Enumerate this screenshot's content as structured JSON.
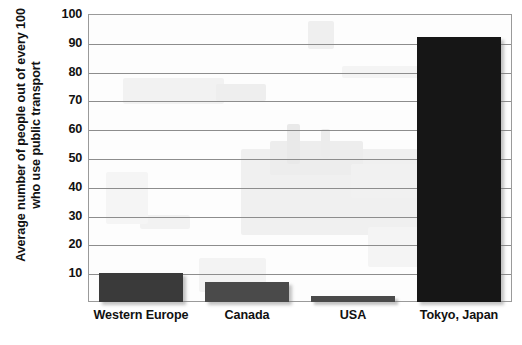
{
  "chart_data": {
    "type": "bar",
    "title": "",
    "subtitle": "",
    "xlabel": "",
    "ylabel": "Average number of people out of every 100 who use public transport",
    "ylabel_lines": [
      "Average number of people out of every 100",
      "who use public transport"
    ],
    "categories": [
      "Western Europe",
      "Canada",
      "USA",
      "Tokyo, Japan"
    ],
    "values": [
      10,
      7,
      2,
      92
    ],
    "ylim": [
      0,
      100
    ],
    "y_ticks": [
      0,
      10,
      20,
      30,
      40,
      50,
      60,
      70,
      80,
      90,
      100
    ],
    "y_tick_labels": [
      "",
      "10",
      "20",
      "30",
      "40",
      "50",
      "60",
      "70",
      "80",
      "90",
      "100"
    ],
    "grid": true,
    "grid_axis": "y",
    "legend": false,
    "legend_position": "none",
    "bar_colors": [
      "#3a3a3a",
      "#4a4a4a",
      "#4a4a4a",
      "#161616"
    ],
    "background_image": "faint-train-photo-watermark"
  },
  "style": {
    "page_background": "#ffffff",
    "frame_color": "#9a9a9a",
    "gridline_color": "#8d8d8d",
    "text_color": "#111111"
  },
  "icons": {}
}
